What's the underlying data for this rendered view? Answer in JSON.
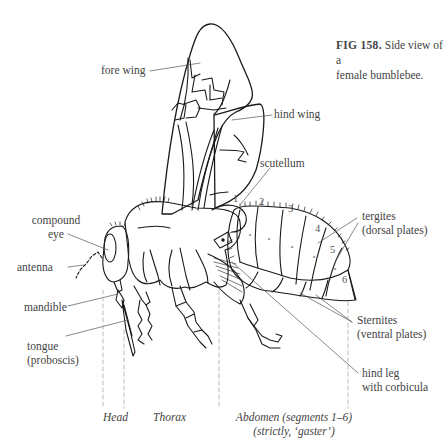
{
  "caption": {
    "figure_label": "FIG 158.",
    "text_line1": "Side view of a",
    "text_line2": "female bumblebee."
  },
  "labels": {
    "fore_wing": "fore wing",
    "hind_wing": "hind wing",
    "scutellum": "scutellum",
    "compound_eye_line1": "compound",
    "compound_eye_line2": "eye",
    "antenna": "antenna",
    "mandible": "mandible",
    "tongue_line1": "tongue",
    "tongue_line2": "(proboscis)",
    "tergites_line1": "tergites",
    "tergites_line2": "(dorsal plates)",
    "sternites_line1": "Sternites",
    "sternites_line2": "(ventral plates)",
    "hind_leg_line1": "hind leg",
    "hind_leg_line2": "with corbicula"
  },
  "segment_numbers": [
    "1",
    "2",
    "3",
    "4",
    "5",
    "6"
  ],
  "regions": {
    "head": "Head",
    "thorax": "Thorax",
    "abdomen_line1": "Abdomen (segments 1–6)",
    "abdomen_line2": "(strictly, ‘gaster’)"
  },
  "colors": {
    "ink": "#1a1a1a",
    "label_text": "#444444",
    "leader_line": "#555555",
    "dashed_divider": "#aaaaaa"
  }
}
